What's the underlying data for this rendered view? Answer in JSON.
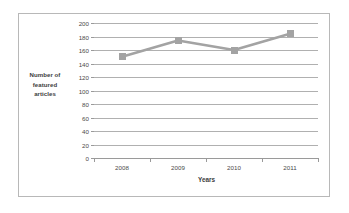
{
  "chart_data": {
    "type": "line",
    "title": "",
    "xlabel": "Years",
    "ylabel": "Number of featured articles",
    "categories": [
      "2008",
      "2009",
      "2010",
      "2011"
    ],
    "values": [
      150,
      174,
      160,
      184
    ],
    "series": [
      {
        "name": "Number of featured articles",
        "values": [
          150,
          174,
          160,
          184
        ]
      }
    ],
    "ylim": [
      0,
      200
    ],
    "ytick_step": 20,
    "yticks": [
      0,
      20,
      40,
      60,
      80,
      100,
      120,
      140,
      160,
      180,
      200
    ],
    "ytick_labels": [
      "0",
      "20",
      "40",
      "60",
      "80",
      "100",
      "120",
      "140",
      "160",
      "180",
      "200"
    ],
    "grid": true,
    "grid_axis": "y",
    "legend": false,
    "legend_position": "none",
    "marker": "square",
    "series_color": "#a3a3a3",
    "line_color": "#a3a3a3",
    "gridline_color": "#b0b0b0",
    "axis_color": "#9a9a9a",
    "background_color": "#ffffff",
    "frame_border_color": "#b8b8b8"
  },
  "axis": {
    "y_title_lines": [
      "Number of",
      "featured",
      "articles"
    ],
    "x_title": "Years"
  }
}
